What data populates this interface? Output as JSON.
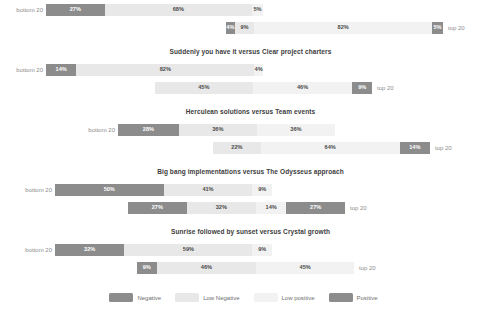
{
  "chart_data": {
    "type": "bar",
    "subtype": "diverging-stacked-likert",
    "title": "",
    "xlabel": "",
    "ylabel": "",
    "grid": false,
    "legend_position": "bottom",
    "legend": [
      "Negative",
      "Low Negative",
      "Low positive",
      "Positive"
    ],
    "colors": {
      "Negative": "#8c8c8c",
      "Low Negative": "#e8e8e8",
      "Low positive": "#f2f2f2",
      "Positive": "#8c8c8c"
    },
    "row_labels": {
      "left": "bottom 20",
      "right": "top 20"
    },
    "categories": [
      "Negative",
      "Low Negative",
      "Low positive",
      "Positive"
    ],
    "panels": [
      {
        "title": "",
        "rows": [
          {
            "group": "bottom 20",
            "values": [
              27,
              68,
              5,
              0
            ],
            "labels": [
              "27%",
              "68%",
              "5%",
              ""
            ]
          },
          {
            "group": "top 20",
            "values": [
              4,
              9,
              82,
              5
            ],
            "labels": [
              "4%",
              "9%",
              "82%",
              "5%"
            ]
          }
        ]
      },
      {
        "title": "Suddenly you have it versus Clear project charters",
        "rows": [
          {
            "group": "bottom 20",
            "values": [
              14,
              82,
              4,
              0
            ],
            "labels": [
              "14%",
              "82%",
              "4%",
              ""
            ]
          },
          {
            "group": "top 20",
            "values": [
              0,
              45,
              46,
              9
            ],
            "labels": [
              "",
              "45%",
              "46%",
              "9%"
            ]
          }
        ]
      },
      {
        "title": "Herculean solutions versus Team events",
        "rows": [
          {
            "group": "bottom 20",
            "values": [
              28,
              36,
              36,
              0
            ],
            "labels": [
              "28%",
              "36%",
              "36%",
              ""
            ]
          },
          {
            "group": "top 20",
            "values": [
              0,
              22,
              64,
              14
            ],
            "labels": [
              "",
              "22%",
              "64%",
              "14%"
            ]
          }
        ]
      },
      {
        "title": "Big bang implementations versus The Odysseus approach",
        "rows": [
          {
            "group": "bottom 20",
            "values": [
              50,
              41,
              9,
              0
            ],
            "labels": [
              "50%",
              "41%",
              "9%",
              ""
            ]
          },
          {
            "group": "top 20",
            "values": [
              27,
              32,
              14,
              27
            ],
            "labels": [
              "27%",
              "32%",
              "14%",
              "27%"
            ]
          }
        ]
      },
      {
        "title": "Sunrise followed by sunset versus Crystal growth",
        "rows": [
          {
            "group": "bottom 20",
            "values": [
              32,
              59,
              9,
              0
            ],
            "labels": [
              "32%",
              "59%",
              "9%",
              ""
            ]
          },
          {
            "group": "top 20",
            "values": [
              9,
              46,
              45,
              0
            ],
            "labels": [
              "9%",
              "46%",
              "45%",
              ""
            ]
          }
        ]
      }
    ]
  },
  "panel_titles": [
    "",
    "Suddenly you have it versus Clear project charters",
    "Herculean solutions versus Team events",
    "Big bang implementations versus The Odysseus approach",
    "Sunrise followed by sunset versus Crystal growth"
  ],
  "legend": {
    "items": [
      {
        "label": "Negative",
        "color": "#8c8c8c"
      },
      {
        "label": "Low Negative",
        "color": "#e8e8e8"
      },
      {
        "label": "Low positive",
        "color": "#f2f2f2"
      },
      {
        "label": "Positive",
        "color": "#8c8c8c"
      }
    ]
  },
  "axis": {
    "left_label": "bottom 20",
    "right_label": "top 20"
  }
}
